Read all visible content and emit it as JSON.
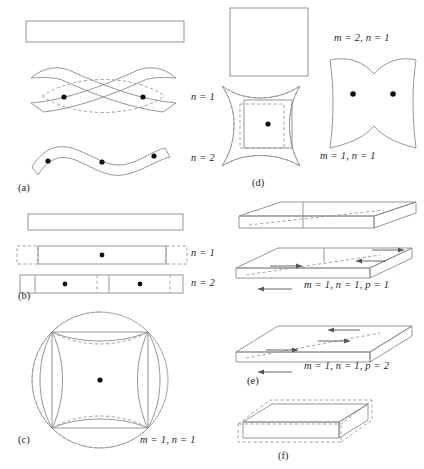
{
  "figure": {
    "background_color": "#ffffff",
    "line_color": "#8a8a8a",
    "node_color": "#111111",
    "panels": [
      {
        "id": "a",
        "label": "(a)",
        "description": "Straight beam: undeformed bar, first bending mode, second bending mode",
        "mode_labels": [
          "n = 1",
          "n = 2"
        ]
      },
      {
        "id": "b",
        "label": "(b)",
        "description": "Straight bar: undeformed bar, first longitudinal mode, second longitudinal mode",
        "mode_labels": [
          "n = 1",
          "n = 2"
        ]
      },
      {
        "id": "c",
        "label": "(c)",
        "description": "Circular membrane with inscribed square, fundamental mode",
        "mode_labels": [
          "m = 1, n = 1"
        ]
      },
      {
        "id": "d",
        "label": "(d)",
        "description": "Square plate: undeformed plate, fundamental mode, second mode",
        "mode_labels": [
          "m = 1, n = 1",
          "m = 2, n = 1"
        ]
      },
      {
        "id": "e",
        "label": "(e)",
        "description": "Rectangular solid plate: undeformed, shear mode p = 1, shear mode p = 2",
        "mode_labels": [
          "m = 1, n = 1, p = 1",
          "m = 1, n = 1, p = 2"
        ]
      },
      {
        "id": "f",
        "label": "(f)",
        "description": "Rectangular solid plate, dilatational mode shown dashed",
        "mode_labels": []
      }
    ],
    "labels": {
      "a_n1": "n = 1",
      "a_n2": "n = 2",
      "a_panel": "(a)",
      "b_n1": "n = 1",
      "b_n2": "n = 2",
      "b_panel": "(b)",
      "c_mode": "m = 1, n = 1",
      "c_panel": "(c)",
      "d_mode_1": "m = 2, n = 1",
      "d_mode_2": "m = 1, n = 1",
      "d_panel": "(d)",
      "e_mode_1": "m = 1, n = 1, p = 1",
      "e_mode_2": "m = 1, n = 1, p = 2",
      "e_panel": "(e)",
      "f_panel": "(f)"
    }
  }
}
